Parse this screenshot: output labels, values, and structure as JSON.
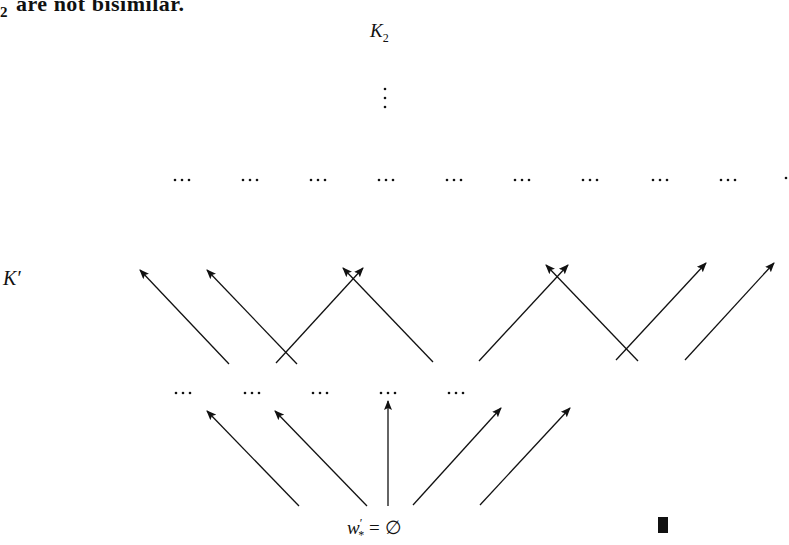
{
  "text": {
    "clipped_line_sub": "2",
    "clipped_line": "are not bisimilar."
  },
  "labels": {
    "top_node": {
      "base": "K",
      "sub": "2"
    },
    "left_label": {
      "base": "K",
      "prime": "′"
    },
    "root": {
      "base": "w",
      "prime": "′",
      "sub": "*",
      "rest": " = ∅"
    },
    "vdots": "⋮"
  },
  "diagram": {
    "stroke": "#111111",
    "upper_dots_y": 180,
    "upper_dots_x": [
      182,
      250,
      318,
      386,
      454,
      522,
      590,
      660,
      728
    ],
    "upper_partial_dot_x": 786,
    "lower_dots_y": 393,
    "lower_dots_x": [
      183,
      252,
      320,
      388,
      456
    ],
    "upper_arrows": [
      {
        "x1": 229,
        "y1": 364,
        "x2": 140,
        "y2": 270
      },
      {
        "x1": 297,
        "y1": 364,
        "x2": 207,
        "y2": 270
      },
      {
        "x1": 276,
        "y1": 363,
        "x2": 363,
        "y2": 268
      },
      {
        "x1": 433,
        "y1": 362,
        "x2": 343,
        "y2": 268
      },
      {
        "x1": 479,
        "y1": 361,
        "x2": 568,
        "y2": 265
      },
      {
        "x1": 638,
        "y1": 361,
        "x2": 546,
        "y2": 265
      },
      {
        "x1": 616,
        "y1": 360,
        "x2": 706,
        "y2": 263
      },
      {
        "x1": 685,
        "y1": 360,
        "x2": 774,
        "y2": 263
      }
    ],
    "lower_arrows": [
      {
        "x1": 299,
        "y1": 506,
        "x2": 207,
        "y2": 411
      },
      {
        "x1": 367,
        "y1": 506,
        "x2": 275,
        "y2": 411
      },
      {
        "x1": 388,
        "y1": 506,
        "x2": 388,
        "y2": 401
      },
      {
        "x1": 413,
        "y1": 505,
        "x2": 501,
        "y2": 408
      },
      {
        "x1": 480,
        "y1": 505,
        "x2": 570,
        "y2": 408
      }
    ]
  },
  "qed_symbol": "end-of-proof"
}
